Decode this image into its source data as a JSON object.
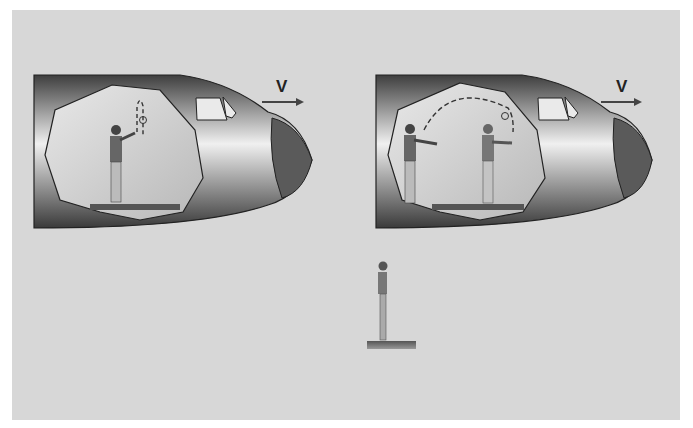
{
  "figure": {
    "panels": [
      {
        "id": "left",
        "velocity_label": "V",
        "scene": "person tossing ball straight up inside plane"
      },
      {
        "id": "right",
        "velocity_label": "V",
        "scene": "person throwing ball in arc to second person inside plane"
      }
    ],
    "ground_observer": {
      "scene": "person on ground looking up"
    },
    "colors": {
      "background": "#d7d7d7",
      "fuselage_dark": "#4a4a4a",
      "fuselage_light": "#e6e6e6",
      "cabin": "#c9c9c9",
      "nose": "#5a5a5a"
    }
  }
}
